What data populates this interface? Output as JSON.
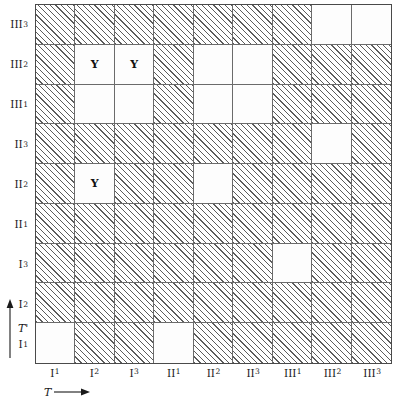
{
  "figure": {
    "type": "hatched-grid-matrix",
    "rows": 9,
    "cols": 9,
    "axes": {
      "x_label": "T",
      "x_arrow": "right-arrow",
      "y_label": "T'",
      "y_arrow": "up-arrow"
    },
    "col_labels": [
      {
        "main": "I",
        "sub": "1"
      },
      {
        "main": "I",
        "sub": "2"
      },
      {
        "main": "I",
        "sub": "3"
      },
      {
        "main": "II",
        "sub": "1"
      },
      {
        "main": "II",
        "sub": "2"
      },
      {
        "main": "II",
        "sub": "3"
      },
      {
        "main": "III",
        "sub": "1"
      },
      {
        "main": "III",
        "sub": "2"
      },
      {
        "main": "III",
        "sub": "3"
      }
    ],
    "row_labels": [
      {
        "main": "III",
        "sub": "3"
      },
      {
        "main": "III",
        "sub": "2"
      },
      {
        "main": "III",
        "sub": "1"
      },
      {
        "main": "II",
        "sub": "3"
      },
      {
        "main": "II",
        "sub": "2"
      },
      {
        "main": "II",
        "sub": "1"
      },
      {
        "main": "I",
        "sub": "3"
      },
      {
        "main": "I",
        "sub": "2"
      },
      {
        "main": "I",
        "sub": "1"
      }
    ],
    "cell_fill_legend": {
      "hatch": "diagonal-hatched",
      "blank": "white-empty"
    },
    "colors": {
      "hatch_line": "#5c5c5c",
      "grid_line": "#6b6b6b",
      "border": "#4a4a4a",
      "blank_fill": "#fdfdfd",
      "text": "#1a1a1a"
    },
    "cells": [
      [
        {
          "fill": "hatch",
          "label": ""
        },
        {
          "fill": "hatch",
          "label": ""
        },
        {
          "fill": "hatch",
          "label": ""
        },
        {
          "fill": "hatch",
          "label": ""
        },
        {
          "fill": "hatch",
          "label": ""
        },
        {
          "fill": "hatch",
          "label": ""
        },
        {
          "fill": "hatch",
          "label": ""
        },
        {
          "fill": "blank",
          "label": ""
        },
        {
          "fill": "blank",
          "label": ""
        }
      ],
      [
        {
          "fill": "hatch",
          "label": ""
        },
        {
          "fill": "blank",
          "label": "Y"
        },
        {
          "fill": "blank",
          "label": "Y"
        },
        {
          "fill": "hatch",
          "label": ""
        },
        {
          "fill": "blank",
          "label": ""
        },
        {
          "fill": "blank",
          "label": ""
        },
        {
          "fill": "hatch",
          "label": ""
        },
        {
          "fill": "hatch",
          "label": ""
        },
        {
          "fill": "hatch",
          "label": ""
        }
      ],
      [
        {
          "fill": "hatch",
          "label": ""
        },
        {
          "fill": "blank",
          "label": ""
        },
        {
          "fill": "blank",
          "label": ""
        },
        {
          "fill": "hatch",
          "label": ""
        },
        {
          "fill": "blank",
          "label": ""
        },
        {
          "fill": "blank",
          "label": ""
        },
        {
          "fill": "hatch",
          "label": ""
        },
        {
          "fill": "hatch",
          "label": ""
        },
        {
          "fill": "hatch",
          "label": ""
        }
      ],
      [
        {
          "fill": "hatch",
          "label": ""
        },
        {
          "fill": "hatch",
          "label": ""
        },
        {
          "fill": "hatch",
          "label": ""
        },
        {
          "fill": "hatch",
          "label": ""
        },
        {
          "fill": "hatch",
          "label": ""
        },
        {
          "fill": "hatch",
          "label": ""
        },
        {
          "fill": "hatch",
          "label": ""
        },
        {
          "fill": "blank",
          "label": ""
        },
        {
          "fill": "hatch",
          "label": ""
        }
      ],
      [
        {
          "fill": "hatch",
          "label": ""
        },
        {
          "fill": "blank",
          "label": "Y"
        },
        {
          "fill": "hatch",
          "label": ""
        },
        {
          "fill": "hatch",
          "label": ""
        },
        {
          "fill": "blank",
          "label": ""
        },
        {
          "fill": "hatch",
          "label": ""
        },
        {
          "fill": "hatch",
          "label": ""
        },
        {
          "fill": "hatch",
          "label": ""
        },
        {
          "fill": "hatch",
          "label": ""
        }
      ],
      [
        {
          "fill": "hatch",
          "label": ""
        },
        {
          "fill": "hatch",
          "label": ""
        },
        {
          "fill": "hatch",
          "label": ""
        },
        {
          "fill": "hatch",
          "label": ""
        },
        {
          "fill": "hatch",
          "label": ""
        },
        {
          "fill": "hatch",
          "label": ""
        },
        {
          "fill": "hatch",
          "label": ""
        },
        {
          "fill": "hatch",
          "label": ""
        },
        {
          "fill": "hatch",
          "label": ""
        }
      ],
      [
        {
          "fill": "hatch",
          "label": ""
        },
        {
          "fill": "hatch",
          "label": ""
        },
        {
          "fill": "hatch",
          "label": ""
        },
        {
          "fill": "hatch",
          "label": ""
        },
        {
          "fill": "hatch",
          "label": ""
        },
        {
          "fill": "hatch",
          "label": ""
        },
        {
          "fill": "blank",
          "label": ""
        },
        {
          "fill": "hatch",
          "label": ""
        },
        {
          "fill": "hatch",
          "label": ""
        }
      ],
      [
        {
          "fill": "hatch",
          "label": ""
        },
        {
          "fill": "hatch",
          "label": ""
        },
        {
          "fill": "hatch",
          "label": ""
        },
        {
          "fill": "hatch",
          "label": ""
        },
        {
          "fill": "hatch",
          "label": ""
        },
        {
          "fill": "hatch",
          "label": ""
        },
        {
          "fill": "hatch",
          "label": ""
        },
        {
          "fill": "hatch",
          "label": ""
        },
        {
          "fill": "hatch",
          "label": ""
        }
      ],
      [
        {
          "fill": "blank",
          "label": ""
        },
        {
          "fill": "hatch",
          "label": ""
        },
        {
          "fill": "hatch",
          "label": ""
        },
        {
          "fill": "blank",
          "label": ""
        },
        {
          "fill": "hatch",
          "label": ""
        },
        {
          "fill": "hatch",
          "label": ""
        },
        {
          "fill": "hatch",
          "label": ""
        },
        {
          "fill": "hatch",
          "label": ""
        },
        {
          "fill": "hatch",
          "label": ""
        }
      ]
    ]
  }
}
